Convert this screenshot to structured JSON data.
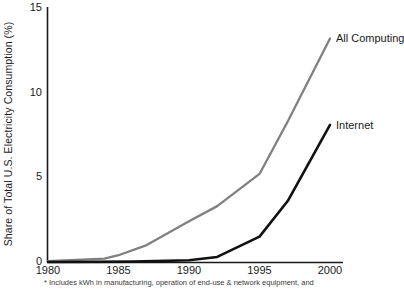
{
  "chart_data": {
    "type": "line",
    "title": "",
    "xlabel": "",
    "ylabel": "Share of Total U.S. Electricity Consumption (%)",
    "xlim": [
      1980,
      2001
    ],
    "ylim": [
      0,
      15
    ],
    "grid": false,
    "legend_position": "inline-right-of-line-end",
    "x_ticks": [
      1980,
      1985,
      1990,
      1995,
      2000
    ],
    "x_tick_labels": [
      "1980",
      "1985",
      "1990",
      "1995",
      "2000"
    ],
    "y_ticks": [
      0,
      5,
      10,
      15
    ],
    "y_tick_labels": [
      "0",
      "5",
      "10",
      "15"
    ],
    "series": [
      {
        "name": "All Computing",
        "color": "#808080",
        "x": [
          1980,
          1984,
          1985,
          1987,
          1990,
          1992,
          1995,
          1997,
          2000
        ],
        "values": [
          0.05,
          0.2,
          0.4,
          1.0,
          2.4,
          3.3,
          5.2,
          8.3,
          13.2
        ]
      },
      {
        "name": "Internet",
        "color": "#111111",
        "x": [
          1980,
          1986,
          1990,
          1992,
          1995,
          1997,
          2000
        ],
        "values": [
          0,
          0.02,
          0.1,
          0.3,
          1.5,
          3.6,
          8.1
        ]
      }
    ],
    "annotations": [
      "* Includes kWh in manufacturing, operation of end-use & network equipment, and"
    ]
  },
  "axes": {
    "y_title": "Share of Total U.S. Electricity Consumption (%)"
  },
  "footnote": {
    "text": "* Includes kWh in manufacturing, operation of end-use & network equipment, and"
  },
  "colors": {
    "all_computing": "#808080",
    "internet": "#111111",
    "axis": "#1a1a1a",
    "background": "#ffffff"
  }
}
